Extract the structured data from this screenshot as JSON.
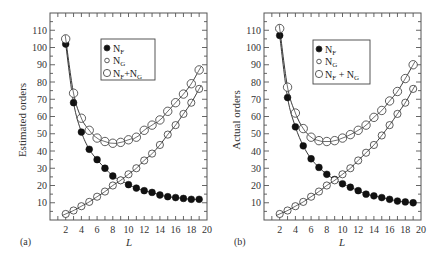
{
  "chart_data": [
    {
      "type": "line",
      "panel_label": "(a)",
      "title": "",
      "xlabel": "L",
      "ylabel": "Estimated orders",
      "xlim": [
        0,
        20
      ],
      "ylim": [
        0,
        120
      ],
      "xticks": [
        2,
        4,
        6,
        8,
        10,
        12,
        14,
        16,
        18,
        20
      ],
      "yticks": [
        10,
        20,
        30,
        40,
        50,
        60,
        70,
        80,
        90,
        100,
        110
      ],
      "grid": false,
      "legend_position": "top-center",
      "x": [
        2,
        3,
        4,
        5,
        6,
        7,
        8,
        9,
        10,
        11,
        12,
        13,
        14,
        15,
        16,
        17,
        18,
        19
      ],
      "series": [
        {
          "name": "N_F",
          "label_main": "N",
          "label_sub": "F",
          "marker": "filled-circle",
          "values": [
            102,
            68,
            51,
            41,
            35,
            30,
            25.5,
            23,
            20.5,
            18.5,
            17,
            16,
            14.5,
            13.5,
            13,
            12.5,
            12,
            12
          ]
        },
        {
          "name": "N_G",
          "label_main": "N",
          "label_sub": "G",
          "marker": "small-open-circle",
          "values": [
            3.5,
            5.5,
            8,
            10.5,
            13.5,
            16.5,
            20,
            23,
            26.5,
            30,
            34.5,
            38.5,
            43.5,
            49.5,
            55,
            61.5,
            68,
            76
          ]
        },
        {
          "name": "N_F+N_G",
          "label_main": "N",
          "label_sub": "F",
          "label_plus": "+N",
          "label_sub2": "G",
          "marker": "large-open-circle",
          "values": [
            105,
            73.5,
            59,
            52,
            47.5,
            45.5,
            44.5,
            45,
            46.5,
            48,
            52,
            55,
            58,
            63,
            68,
            73,
            79,
            87
          ]
        }
      ]
    },
    {
      "type": "line",
      "panel_label": "(b)",
      "title": "",
      "xlabel": "L",
      "ylabel": "Actual orders",
      "xlim": [
        0,
        20
      ],
      "ylim": [
        0,
        120
      ],
      "xticks": [
        2,
        4,
        6,
        8,
        10,
        12,
        14,
        16,
        18,
        20
      ],
      "yticks": [
        10,
        20,
        30,
        40,
        50,
        60,
        70,
        80,
        90,
        100,
        110
      ],
      "grid": false,
      "legend_position": "top-center",
      "x": [
        2,
        3,
        4,
        5,
        6,
        7,
        8,
        9,
        10,
        11,
        12,
        13,
        14,
        15,
        16,
        17,
        18,
        19
      ],
      "series": [
        {
          "name": "N_F",
          "label_main": "N",
          "label_sub": "F",
          "marker": "filled-circle",
          "values": [
            107,
            71,
            54,
            43,
            35.5,
            30.5,
            26.5,
            23.5,
            21,
            19,
            17,
            15,
            14,
            13,
            12,
            11,
            10.5,
            10
          ]
        },
        {
          "name": "N_G",
          "label_main": "N",
          "label_sub": "G",
          "marker": "small-open-circle",
          "values": [
            3.5,
            5.5,
            8,
            10.5,
            13.5,
            16.5,
            20,
            23,
            26.5,
            30,
            34.5,
            39,
            43.5,
            49,
            55,
            61.5,
            68,
            76
          ]
        },
        {
          "name": "N_F+N_G",
          "label_main": "N",
          "label_sub": "F",
          "label_plus": " + N",
          "label_sub2": "G",
          "marker": "large-open-circle",
          "values": [
            111,
            77,
            62,
            53,
            48,
            46,
            45.5,
            46,
            47.5,
            49.5,
            52,
            55,
            59.5,
            63.5,
            69,
            74.5,
            82,
            90
          ]
        }
      ]
    }
  ]
}
